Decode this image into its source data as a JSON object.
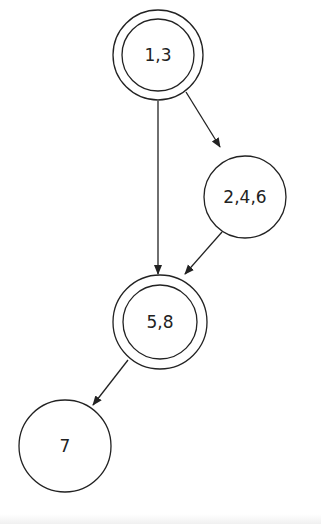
{
  "diagram": {
    "type": "state-diagram",
    "nodes": [
      {
        "id": "n13",
        "label": "1,3",
        "accepting": true
      },
      {
        "id": "n246",
        "label": "2,4,6",
        "accepting": false
      },
      {
        "id": "n58",
        "label": "5,8",
        "accepting": true
      },
      {
        "id": "n7",
        "label": "7",
        "accepting": false
      }
    ],
    "edges": [
      {
        "from": "1,3",
        "to": "5,8"
      },
      {
        "from": "1,3",
        "to": "2,4,6"
      },
      {
        "from": "2,4,6",
        "to": "5,8"
      },
      {
        "from": "5,8",
        "to": "7"
      }
    ],
    "colors": {
      "stroke": "#222222",
      "background": "#ffffff"
    }
  }
}
